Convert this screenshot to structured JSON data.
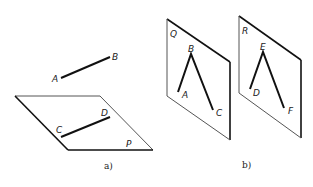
{
  "figure_a": {
    "caption": "a)",
    "segment_ab": {
      "start_label": "A",
      "end_label": "B"
    },
    "plane": {
      "label": "P"
    },
    "segment_cd": {
      "start_label": "C",
      "end_label": "D"
    }
  },
  "figure_b": {
    "caption": "b)",
    "plane_q": {
      "label": "Q",
      "points": {
        "top": "B",
        "left": "A",
        "right": "C"
      }
    },
    "plane_r": {
      "label": "R",
      "points": {
        "top": "E",
        "left": "D",
        "right": "F"
      }
    }
  },
  "colors": {
    "line": "#111111",
    "thin": "#555555",
    "background": "#ffffff"
  }
}
